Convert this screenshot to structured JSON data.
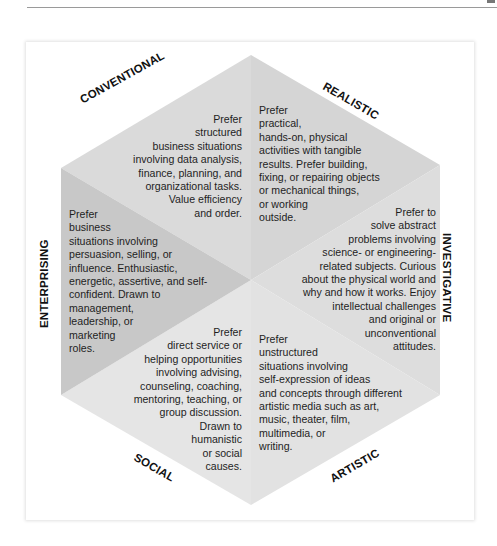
{
  "diagram": {
    "type": "hexagon",
    "colors": {
      "conventional": "#dadada",
      "realistic": "#d6d6d6",
      "investigative": "#dedede",
      "artistic": "#e2e2e2",
      "social": "#e4e4e4",
      "enterprising": "#c9c9c9"
    },
    "sections": {
      "conventional": {
        "label": "CONVENTIONAL",
        "text": "Prefer\nstructured\nbusiness situations\ninvolving data analysis,\nfinance, planning, and\norganizational tasks.\nValue efficiency\nand order."
      },
      "realistic": {
        "label": "REALISTIC",
        "text": "Prefer\npractical,\nhands-on, physical\nactivities with tangible\nresults. Prefer building,\nfixing, or repairing objects\nor mechanical things,\nor working\noutside."
      },
      "investigative": {
        "label": "INVESTIGATIVE",
        "text": "Prefer to\nsolve abstract\nproblems involving\nscience- or engineering-\nrelated subjects. Curious\nabout the physical world and\nwhy and how it works. Enjoy\nintellectual challenges\nand original or\nunconventional\nattitudes."
      },
      "artistic": {
        "label": "ARTISTIC",
        "text": "Prefer\nunstructured\nsituations involving\nself-expression of ideas\nand concepts through different\nartistic media such as art,\nmusic, theater, film,\nmultimedia, or\nwriting."
      },
      "social": {
        "label": "SOCIAL",
        "text": "Prefer\ndirect service or\nhelping opportunities\ninvolving advising,\ncounseling, coaching,\nmentoring, teaching, or\ngroup discussion.\nDrawn to\nhumanistic\nor social\ncauses."
      },
      "enterprising": {
        "label": "ENTERPRISING",
        "text": "Prefer\nbusiness\nsituations involving\npersuasion, selling, or\ninfluence. Enthusiastic,\nenergetic, assertive, and self-\nconfident. Drawn to\nmanagement,\nleadership, or\nmarketing\nroles."
      }
    }
  }
}
